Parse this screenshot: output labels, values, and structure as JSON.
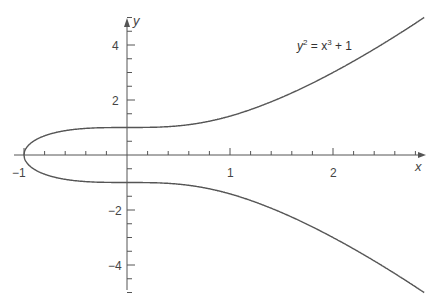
{
  "chart_data": {
    "type": "line",
    "title": "",
    "annotation": "y² = x³ + 1",
    "xlabel": "x",
    "ylabel": "y",
    "xlim": [
      -1.0,
      2.9
    ],
    "ylim": [
      -5.4,
      5.3
    ],
    "x_ticks_major": [
      -1,
      1,
      2
    ],
    "x_tick_labels": [
      "−1",
      "1",
      "2"
    ],
    "x_minor_step": 0.2,
    "y_ticks_major": [
      -4,
      -2,
      2,
      4
    ],
    "y_tick_labels": [
      "−4",
      "−2",
      "2",
      "4"
    ],
    "y_minor_step": 0.5,
    "grid": false,
    "legend": false,
    "series": [
      {
        "name": "upper branch",
        "equation": "y = +sqrt(x^3 + 1)",
        "x": [
          -1,
          -0.9,
          -0.5,
          0,
          0.5,
          1,
          1.5,
          2,
          2.5,
          2.88
        ],
        "values": [
          0,
          0.52,
          0.94,
          1,
          1.06,
          1.41,
          2.09,
          3,
          4.07,
          5.0
        ]
      },
      {
        "name": "lower branch",
        "equation": "y = -sqrt(x^3 + 1)",
        "x": [
          -1,
          -0.9,
          -0.5,
          0,
          0.5,
          1,
          1.5,
          2,
          2.5,
          2.88
        ],
        "values": [
          0,
          -0.52,
          -0.94,
          -1,
          -1.06,
          -1.41,
          -2.09,
          -3,
          -4.07,
          -5.0
        ]
      }
    ]
  },
  "labels": {
    "x_axis": "x",
    "y_axis": "y",
    "equation_y": "y",
    "equation_sup1": "2",
    "equation_mid": " = x",
    "equation_sup2": "3",
    "equation_end": " + 1",
    "xt_m1": "−1",
    "xt_1": "1",
    "xt_2": "2",
    "yt_4": "4",
    "yt_2": "2",
    "yt_m2": "−2",
    "yt_m4": "−4"
  },
  "colors": {
    "curve": "#555555",
    "axis": "#555555"
  }
}
